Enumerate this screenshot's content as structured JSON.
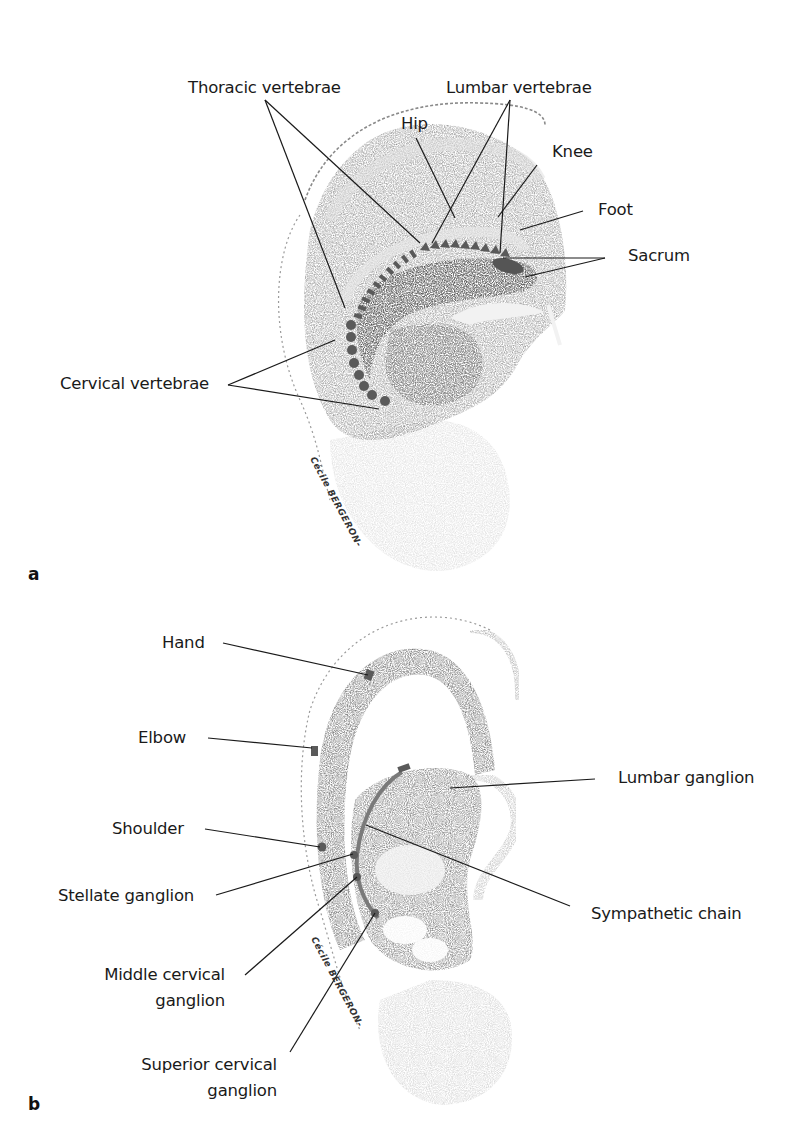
{
  "figure": {
    "panels": [
      {
        "id": "a",
        "letter": "a",
        "artist_signature": "Cécile BERGERON-",
        "labels": {
          "thoracic_vertebrae": "Thoracic vertebrae",
          "lumbar_vertebrae": "Lumbar vertebrae",
          "hip": "Hip",
          "knee": "Knee",
          "foot": "Foot",
          "sacrum": "Sacrum",
          "cervical_vertebrae": "Cervical vertebrae"
        }
      },
      {
        "id": "b",
        "letter": "b",
        "artist_signature": "Cécile BERGERON-",
        "labels": {
          "hand": "Hand",
          "elbow": "Elbow",
          "shoulder": "Shoulder",
          "stellate_ganglion": "Stellate ganglion",
          "middle_cervical_ganglion_line1": "Middle cervical",
          "middle_cervical_ganglion_line2": "ganglion",
          "superior_cervical_ganglion_line1": "Superior cervical",
          "superior_cervical_ganglion_line2": "ganglion",
          "lumbar_ganglion": "Lumbar ganglion",
          "sympathetic_chain": "Sympathetic chain"
        }
      }
    ],
    "colors": {
      "ink": "#1a1a1a",
      "marker": "#5a5a5a",
      "shading_dark": "#3a3a3a",
      "shading_mid": "#8a8a8a",
      "shading_light": "#c8c8c8"
    }
  }
}
